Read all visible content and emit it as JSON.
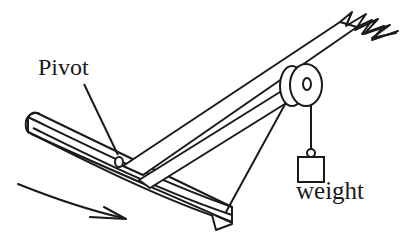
{
  "figure": {
    "type": "mechanics-free-body-sketch",
    "stroke_color": "#1a1a1a",
    "fill_color": "#ffffff",
    "background_color": "#ffffff",
    "line_width": 2
  },
  "labels": {
    "pivot": "Pivot",
    "weight": "weight"
  },
  "parts": {
    "curved_board": {
      "name": "curved-board",
      "description": "long curved plank drawn in 3D perspective sloping down to the right"
    },
    "lever_beam": {
      "name": "lever-beam",
      "description": "straight beam rising to upper right with jagged broken end"
    },
    "diagonal_strut": {
      "name": "diagonal-strut",
      "description": "second beam from pivot region up to the pulley"
    },
    "pulley": {
      "name": "pulley-wheel",
      "description": "two overlapping ellipses forming a 3D pulley with center hole"
    },
    "string_to_board": {
      "name": "string-pulley-to-board",
      "description": "string from pulley down-left to right end of curved board"
    },
    "string_to_weight": {
      "name": "string-pulley-to-weight",
      "description": "vertical string from pulley down to hanging weight"
    },
    "weight_block": {
      "name": "weight-block",
      "description": "square block with small hanging ring on top"
    },
    "pivot_point": {
      "name": "pivot-point",
      "description": "small circle marking the pivot on the board"
    },
    "motion_arrow": {
      "name": "motion-arrow",
      "description": "curved arrow below the board indicating direction of rotation"
    },
    "pointer_line": {
      "name": "pivot-pointer-line",
      "description": "leader line from the Pivot label to the pivot point"
    },
    "broken_end": {
      "name": "beam-broken-end",
      "description": "jagged zigzag marks showing the beam continues beyond the figure"
    }
  },
  "geometry": {
    "pivot_point": {
      "cx": 119,
      "cy": 162,
      "rx": 4,
      "ry": 5
    },
    "pulley": {
      "cx": 300,
      "cy": 85,
      "rx": 16,
      "ry": 21
    },
    "weight_box": {
      "x": 298,
      "y": 157,
      "w": 26,
      "h": 25
    }
  }
}
